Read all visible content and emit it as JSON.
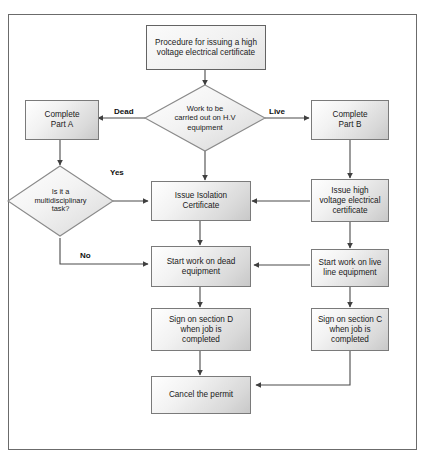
{
  "diagram": {
    "title_box": {
      "label": "Procedure for issuing a high voltage electrical certificate",
      "line1": "Procedure for issuing a high",
      "line2": "voltage electrical certificate"
    },
    "nodes": [
      {
        "id": "complete-part-a",
        "type": "process",
        "label": "Complete Part A",
        "line1": "Complete",
        "line2": "Part A"
      },
      {
        "id": "work-decision",
        "type": "decision",
        "label": "Work to be carried out on H.V equipment",
        "line1": "Work to be",
        "line2": "carried out on H.V",
        "line3": "equipment"
      },
      {
        "id": "complete-part-b",
        "type": "process",
        "label": "Complete Part B",
        "line1": "Complete",
        "line2": "Part B"
      },
      {
        "id": "multidisciplinary-decision",
        "type": "decision",
        "label": "Is it a multidisciplinary task?",
        "line1": "Is it a",
        "line2": "multidisciplinary",
        "line3": "task?"
      },
      {
        "id": "issue-isolation-certificate",
        "type": "process",
        "label": "Issue Isolation Certificate",
        "line1": "Issue Isolation",
        "line2": "Certificate"
      },
      {
        "id": "issue-hv-certificate",
        "type": "process",
        "label": "Issue high voltage electrical certificate",
        "line1": "Issue high",
        "line2": "voltage electrical",
        "line3": "certificate"
      },
      {
        "id": "start-work-dead",
        "type": "process",
        "label": "Start work on dead equipment",
        "line1": "Start work on dead",
        "line2": "equipment"
      },
      {
        "id": "start-work-live",
        "type": "process",
        "label": "Start work on live line equipment",
        "line1": "Start work on live",
        "line2": "line equipment"
      },
      {
        "id": "sign-section-d",
        "type": "process",
        "label": "Sign on section D when job is completed",
        "line1": "Sign on section D",
        "line2": "when job is",
        "line3": "completed"
      },
      {
        "id": "sign-section-c",
        "type": "process",
        "label": "Sign on section C when job is completed",
        "line1": "Sign on section C",
        "line2": "when job is",
        "line3": "completed"
      },
      {
        "id": "cancel-permit",
        "type": "process",
        "label": "Cancel the permit",
        "line1": "Cancel the permit"
      }
    ],
    "edge_labels": {
      "dead": "Dead",
      "live": "Live",
      "yes": "Yes",
      "no": "No"
    },
    "colors": {
      "frame_border": "#6b6b6b",
      "node_border": "#7a7a7a",
      "edge_stroke": "#4a4a4a",
      "text": "#1a1a1a",
      "background": "#ffffff"
    }
  }
}
